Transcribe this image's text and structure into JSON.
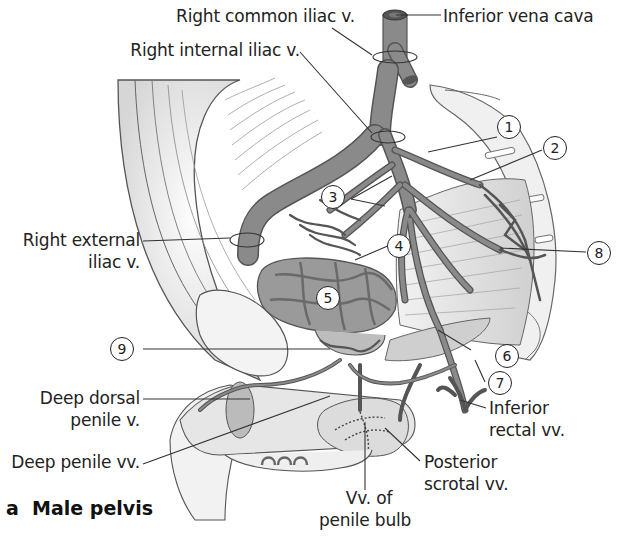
{
  "figure": {
    "caption_letter": "a",
    "caption_title": "Male pelvis",
    "colors": {
      "vein_fill": "#8a8a8a",
      "vein_stroke": "#555555",
      "outline": "#444444",
      "tissue_light": "#e6e6e6",
      "tissue_mid": "#cfcfcf",
      "background": "#ffffff"
    }
  },
  "labels": {
    "right_common_iliac": "Right common iliac v.",
    "inferior_vena_cava": "Inferior vena cava",
    "right_internal_iliac": "Right internal iliac v.",
    "right_external_iliac_1": "Right external",
    "right_external_iliac_2": "iliac v.",
    "deep_dorsal_1": "Deep dorsal",
    "deep_dorsal_2": "penile v.",
    "deep_penile": "Deep penile vv.",
    "vv_penile_bulb_1": "Vv. of",
    "vv_penile_bulb_2": "penile bulb",
    "posterior_scrotal_1": "Posterior",
    "posterior_scrotal_2": "scrotal vv.",
    "inferior_rectal_1": "Inferior",
    "inferior_rectal_2": "rectal vv."
  },
  "callouts": [
    {
      "n": "1"
    },
    {
      "n": "2"
    },
    {
      "n": "3"
    },
    {
      "n": "4"
    },
    {
      "n": "5"
    },
    {
      "n": "6"
    },
    {
      "n": "7"
    },
    {
      "n": "8"
    },
    {
      "n": "9"
    }
  ]
}
